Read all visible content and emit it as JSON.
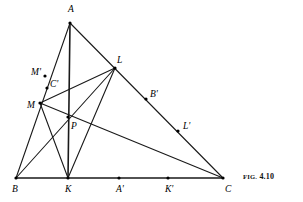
{
  "figure": {
    "caption_prefix": "FIG.",
    "caption_number": "4.10",
    "caption_full": "FIG. 4.10",
    "title": "",
    "stroke_color": "#1a1a1a",
    "vertex_color": "#000000",
    "background_color": "#ffffff",
    "width": 303,
    "height": 202
  },
  "labels": {
    "A": "A",
    "B": "B",
    "C": "C",
    "K": "K",
    "L": "L",
    "M": "M",
    "P": "P",
    "A_prime": "A'",
    "B_prime": "B'",
    "C_prime": "C'",
    "K_prime": "K'",
    "L_prime": "L'",
    "M_prime": "M'"
  },
  "chart_data": {
    "type": "scatter",
    "title": "FIG. 4.10",
    "xlabel": "",
    "ylabel": "",
    "grid": false,
    "legend": "none",
    "xlim": [
      0,
      303
    ],
    "ylim": [
      202,
      0
    ],
    "points": [
      {
        "name": "A",
        "x": 70,
        "y": 23,
        "marker": "dot",
        "label": "A",
        "label_dx": -2,
        "label_dy": -13,
        "on": "apex of triangle ABC"
      },
      {
        "name": "B",
        "x": 16,
        "y": 178,
        "marker": "dot",
        "label": "B",
        "label_dx": -4,
        "label_dy": 12,
        "on": "left base vertex"
      },
      {
        "name": "C",
        "x": 223,
        "y": 178,
        "marker": "dot",
        "label": "C",
        "label_dx": 2,
        "label_dy": 12,
        "on": "right base vertex"
      },
      {
        "name": "K",
        "x": 68,
        "y": 178,
        "marker": "dot",
        "label": "K",
        "label_dx": -3,
        "label_dy": 12,
        "on": "segment BC"
      },
      {
        "name": "A'",
        "x": 119,
        "y": 178,
        "marker": "dot",
        "label": "A'",
        "label_dx": -3,
        "label_dy": 12,
        "on": "segment BC"
      },
      {
        "name": "K'",
        "x": 168,
        "y": 178,
        "marker": "dot",
        "label": "K'",
        "label_dx": -3,
        "label_dy": 12,
        "on": "segment BC"
      },
      {
        "name": "L",
        "x": 115,
        "y": 68,
        "marker": "dot",
        "label": "L",
        "label_dx": 2,
        "label_dy": -7,
        "on": "segment AC"
      },
      {
        "name": "B'",
        "x": 146,
        "y": 99,
        "marker": "dot",
        "label": "B'",
        "label_dx": 4,
        "label_dy": -4,
        "on": "segment AC"
      },
      {
        "name": "L'",
        "x": 178,
        "y": 131,
        "marker": "dot",
        "label": "L'",
        "label_dx": 5,
        "label_dy": -4,
        "on": "segment AC"
      },
      {
        "name": "M",
        "x": 40,
        "y": 103,
        "marker": "dot",
        "label": "M",
        "label_dx": -13,
        "label_dy": 3,
        "on": "segment AB"
      },
      {
        "name": "M'",
        "x": 45,
        "y": 76,
        "marker": "dot",
        "label": "M'",
        "label_dx": -14,
        "label_dy": -3,
        "on": "segment AB"
      },
      {
        "name": "C'",
        "x": 47,
        "y": 88,
        "marker": "dot",
        "label": "C'",
        "label_dx": 3,
        "label_dy": -3,
        "on": "segment ML"
      },
      {
        "name": "P",
        "x": 68,
        "y": 117,
        "marker": "dot",
        "label": "P",
        "label_dx": 3,
        "label_dy": 10,
        "on": "intersection of AK, ML, BL"
      }
    ],
    "segments": [
      {
        "from": "A",
        "to": "B",
        "weight": 1.1
      },
      {
        "from": "A",
        "to": "C",
        "weight": 1.1
      },
      {
        "from": "B",
        "to": "C",
        "weight": 1.6
      },
      {
        "from": "A",
        "to": "K",
        "weight": 1.6
      },
      {
        "from": "B",
        "to": "L",
        "weight": 1.1
      },
      {
        "from": "M",
        "to": "L",
        "weight": 1.1
      },
      {
        "from": "M",
        "to": "C",
        "weight": 1.1
      },
      {
        "from": "M",
        "to": "K",
        "weight": 1.1
      },
      {
        "from": "K",
        "to": "L",
        "weight": 1.1
      }
    ]
  }
}
